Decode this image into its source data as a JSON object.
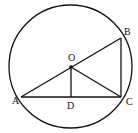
{
  "diagram": {
    "type": "geometry",
    "circle": {
      "center_label": "O",
      "cx": 70.5,
      "cy": 66.5,
      "r": 61.5
    },
    "points": {
      "A": {
        "label": "A",
        "x": 21,
        "y": 97,
        "lx": 12,
        "ly": 104
      },
      "B": {
        "label": "B",
        "x": 121,
        "y": 38,
        "lx": 124,
        "ly": 35
      },
      "C": {
        "label": "C",
        "x": 121,
        "y": 97,
        "lx": 126,
        "ly": 105
      },
      "O": {
        "label": "O",
        "x": 71,
        "y": 67,
        "lx": 68,
        "ly": 61
      },
      "D": {
        "label": "D",
        "x": 71,
        "y": 97,
        "lx": 67,
        "ly": 109
      }
    },
    "segments": [
      {
        "from": "A",
        "to": "B",
        "name": "AB"
      },
      {
        "from": "A",
        "to": "C",
        "name": "AC"
      },
      {
        "from": "B",
        "to": "C",
        "name": "BC"
      },
      {
        "from": "O",
        "to": "C",
        "name": "OC"
      },
      {
        "from": "O",
        "to": "D",
        "name": "OD"
      }
    ],
    "stroke_color": "#111111"
  }
}
